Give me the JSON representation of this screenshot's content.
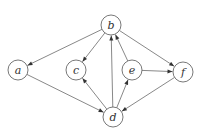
{
  "graph": {
    "type": "directed",
    "nodes": [
      {
        "id": "a",
        "label": "a",
        "x": 18,
        "y": 70
      },
      {
        "id": "b",
        "label": "b",
        "x": 111,
        "y": 25
      },
      {
        "id": "c",
        "label": "c",
        "x": 76,
        "y": 70
      },
      {
        "id": "d",
        "label": "d",
        "x": 113,
        "y": 117
      },
      {
        "id": "e",
        "label": "e",
        "x": 132,
        "y": 70
      },
      {
        "id": "f",
        "label": "f",
        "x": 183,
        "y": 72
      }
    ],
    "edges": [
      {
        "from": "b",
        "to": "a"
      },
      {
        "from": "b",
        "to": "c"
      },
      {
        "from": "d",
        "to": "b"
      },
      {
        "from": "e",
        "to": "b"
      },
      {
        "from": "b",
        "to": "f"
      },
      {
        "from": "e",
        "to": "f"
      },
      {
        "from": "a",
        "to": "d"
      },
      {
        "from": "d",
        "to": "c"
      },
      {
        "from": "d",
        "to": "e"
      },
      {
        "from": "f",
        "to": "d"
      }
    ],
    "node_radius": 10
  }
}
